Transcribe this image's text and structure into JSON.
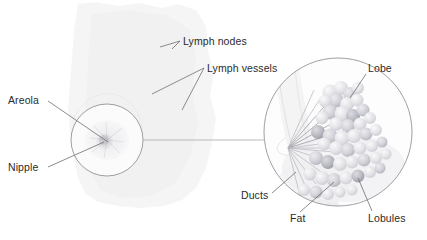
{
  "figure": {
    "background_color": "#ffffff",
    "text_color": "#2b2b2b",
    "leader_line_color": "#6e6e72",
    "circle_outline_color": "#8e8e93",
    "tissue_fill_color": "#f2f2f3",
    "lobule_light_color": "#e3e3e7",
    "lobule_mid_color": "#c9c9d0",
    "lobule_dark_color": "#aeaeb6"
  },
  "labels": {
    "areola": "Areola",
    "nipple": "Nipple",
    "lymph_nodes": "Lymph nodes",
    "lymph_vessels": "Lymph vessels",
    "lobe": "Lobe",
    "ducts": "Ducts",
    "fat": "Fat",
    "lobules": "Lobules"
  },
  "overview_circle": {
    "name": "nipple-areola-closeup",
    "center_x": 107,
    "center_y": 140,
    "radius": 36
  },
  "detail_circle": {
    "name": "internal-structure-closeup",
    "center_x": 338,
    "center_y": 132,
    "radius": 74
  },
  "connector": {
    "from_x": 143,
    "to_x": 264,
    "y": 140
  }
}
